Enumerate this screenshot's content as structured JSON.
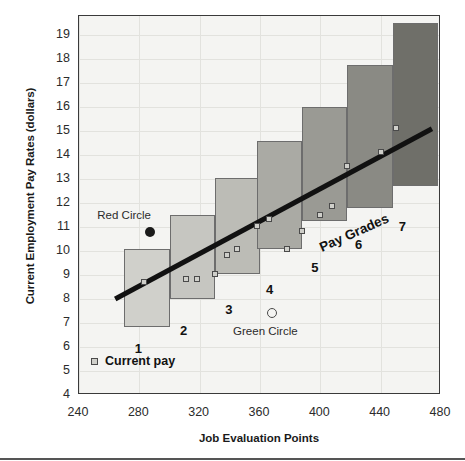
{
  "chart_data": {
    "type": "bar",
    "title": "",
    "xlabel": "Job Evaluation Points",
    "ylabel": "Current Employment Pay Rates (dollars)",
    "xlim": [
      240,
      480
    ],
    "ylim": [
      4,
      19.8
    ],
    "xticks": [
      240,
      280,
      320,
      360,
      400,
      440,
      480
    ],
    "yticks": [
      4,
      5,
      6,
      7,
      8,
      9,
      10,
      11,
      12,
      13,
      14,
      15,
      16,
      17,
      18,
      19
    ],
    "grid": true,
    "legend": [
      {
        "label": "Current pay",
        "marker": "small-square",
        "color": "#cfcfca"
      }
    ],
    "series_group_label": "Pay Grades",
    "bars": [
      {
        "grade": "1",
        "x_start": 270,
        "x_end": 300,
        "y_min": 6.85,
        "y_max": 10.1,
        "color": "#d0d0cb"
      },
      {
        "grade": "2",
        "x_start": 300,
        "x_end": 330,
        "y_min": 8.0,
        "y_max": 11.5,
        "color": "#c6c6c1"
      },
      {
        "grade": "3",
        "x_start": 330,
        "x_end": 360,
        "y_min": 9.05,
        "y_max": 13.05,
        "color": "#bcbcb6"
      },
      {
        "grade": "4",
        "x_start": 358,
        "x_end": 388,
        "y_min": 10.1,
        "y_max": 14.6,
        "color": "#aaaaa4"
      },
      {
        "grade": "5",
        "x_start": 388,
        "x_end": 418,
        "y_min": 11.25,
        "y_max": 16.0,
        "color": "#9a9a94"
      },
      {
        "grade": "6",
        "x_start": 418,
        "x_end": 448,
        "y_min": 11.8,
        "y_max": 17.75,
        "color": "#8a8a84"
      },
      {
        "grade": "7",
        "x_start": 448,
        "x_end": 478,
        "y_min": 12.7,
        "y_max": 19.5,
        "color": "#6f6f69"
      }
    ],
    "current_pay_points": [
      {
        "x": 283,
        "y": 8.7
      },
      {
        "x": 311,
        "y": 8.85
      },
      {
        "x": 318,
        "y": 8.85
      },
      {
        "x": 330,
        "y": 9.05
      },
      {
        "x": 338,
        "y": 9.85
      },
      {
        "x": 345,
        "y": 10.1
      },
      {
        "x": 358,
        "y": 11.05
      },
      {
        "x": 366,
        "y": 11.35
      },
      {
        "x": 378,
        "y": 10.1
      },
      {
        "x": 388,
        "y": 10.85
      },
      {
        "x": 400,
        "y": 11.5
      },
      {
        "x": 408,
        "y": 11.9
      },
      {
        "x": 418,
        "y": 13.55
      },
      {
        "x": 440,
        "y": 14.15
      },
      {
        "x": 450,
        "y": 15.15
      }
    ],
    "trendline": {
      "x_start": 264,
      "y_start": 8.0,
      "x_end": 474,
      "y_end": 15.1,
      "color": "#111111"
    },
    "annotations": [
      {
        "name": "red-circle",
        "label": "Red Circle",
        "x": 287,
        "y": 10.8,
        "filled": true,
        "label_x": 276,
        "label_y": 11.5
      },
      {
        "name": "green-circle",
        "label": "Green Circle",
        "x": 368,
        "y": 7.4,
        "filled": false,
        "label_x": 372,
        "label_y": 6.65
      }
    ]
  },
  "axis": {
    "y_title": "Current Employment Pay Rates (dollars)",
    "x_title": "Job Evaluation Points",
    "y_labels": [
      "19",
      "18",
      "17",
      "16",
      "15",
      "14",
      "13",
      "12",
      "11",
      "10",
      "9",
      "8",
      "7",
      "6",
      "5",
      "4"
    ],
    "x_labels": [
      "240",
      "280",
      "320",
      "360",
      "400",
      "440",
      "480"
    ]
  },
  "legend": {
    "label": "Current pay"
  },
  "grades": {
    "group_label": "Pay Grades",
    "labels": [
      "1",
      "2",
      "3",
      "4",
      "5",
      "6",
      "7"
    ]
  },
  "annotations": {
    "red_circle": "Red Circle",
    "green_circle": "Green Circle"
  },
  "colors": {
    "plot_background": "#f4f4f2",
    "gridline": "#e2e2de",
    "frame": "#3a3a3a",
    "trendline": "#111111",
    "marker_fill": "#cfcfca",
    "marker_stroke": "#4a4a4a"
  }
}
